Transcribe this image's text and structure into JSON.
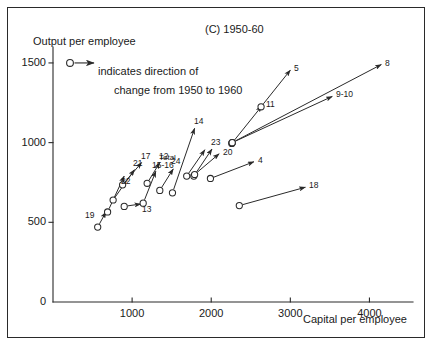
{
  "chart_data": {
    "type": "scatter",
    "title": "(C) 1950-60",
    "xlabel": "Capital per employee",
    "ylabel": "Output per employee",
    "xlim": [
      0,
      4500
    ],
    "ylim": [
      0,
      1600
    ],
    "grid": false,
    "legend_position": "top-left-inside",
    "legend": {
      "marker": "circle-with-arrow",
      "line1": "indicates direction of",
      "line2": "change from 1950 to 1960"
    },
    "xticks": [
      "1000",
      "2000",
      "3000",
      "4000"
    ],
    "xtick_values": [
      1000,
      2000,
      3000,
      4000
    ],
    "yticks": [
      "0",
      "500",
      "1000",
      "1500"
    ],
    "ytick_values": [
      0,
      500,
      1000,
      1500
    ],
    "annotation_note": "Each arrow starts at a circle (1950 value) and points to the 1960 value; the number labels the industry.",
    "points": [
      {
        "label": "19",
        "x0": 565,
        "y0": 470,
        "x1": 670,
        "y1": 565,
        "label_pos": "left"
      },
      {
        "label": "22",
        "x0": 690,
        "y0": 565,
        "x1": 900,
        "y1": 790,
        "label_pos": "below"
      },
      {
        "label": "21",
        "x0": 760,
        "y0": 640,
        "x1": 1030,
        "y1": 830,
        "label_pos": "above"
      },
      {
        "label": "17",
        "x0": 880,
        "y0": 735,
        "x1": 1120,
        "y1": 875,
        "label_pos": "above"
      },
      {
        "label": "13",
        "x0": 900,
        "y0": 600,
        "x1": 1110,
        "y1": 615,
        "label_pos": "below"
      },
      {
        "label": "15-16",
        "x0": 1140,
        "y0": 620,
        "x1": 1300,
        "y1": 820,
        "label_pos": "above"
      },
      {
        "label": "12",
        "x0": 1190,
        "y0": 745,
        "x1": 1350,
        "y1": 875,
        "label_pos": "above"
      },
      {
        "label": "24",
        "x0": 1350,
        "y0": 700,
        "x1": 1520,
        "y1": 835,
        "label_pos": "above"
      },
      {
        "label": "14",
        "x0": 1510,
        "y0": 685,
        "x1": 1790,
        "y1": 1090,
        "label_pos": "above"
      },
      {
        "label": "Total",
        "x0": 1690,
        "y0": 790,
        "x1": 1920,
        "y1": 955,
        "label_pos": "left"
      },
      {
        "label": "23",
        "x0": 1780,
        "y0": 790,
        "x1": 2010,
        "y1": 960,
        "label_pos": "above"
      },
      {
        "label": "20",
        "x0": 1790,
        "y0": 800,
        "x1": 2100,
        "y1": 930,
        "label_pos": "right"
      },
      {
        "label": "4",
        "x0": 1990,
        "y0": 775,
        "x1": 2540,
        "y1": 880,
        "label_pos": "right"
      },
      {
        "label": "18",
        "x0": 2355,
        "y0": 605,
        "x1": 3190,
        "y1": 720,
        "label_pos": "right"
      },
      {
        "label": "11",
        "x0": 2260,
        "y0": 995,
        "x1": 2640,
        "y1": 1230,
        "label_pos": "right"
      },
      {
        "label": "5",
        "x0": 2630,
        "y0": 1225,
        "x1": 3000,
        "y1": 1455,
        "label_pos": "right"
      },
      {
        "label": "9-10",
        "x0": 2265,
        "y0": 1000,
        "x1": 3530,
        "y1": 1290,
        "label_pos": "right"
      },
      {
        "label": "8",
        "x0": 2265,
        "y0": 1000,
        "x1": 4150,
        "y1": 1490,
        "label_pos": "right"
      }
    ]
  }
}
